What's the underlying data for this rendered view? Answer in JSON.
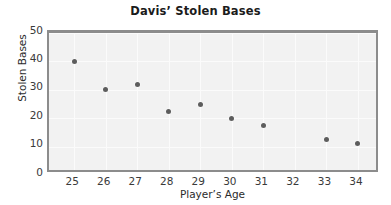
{
  "chart_data": {
    "type": "scatter",
    "title": "Davis’ Stolen Bases",
    "xlabel": "Player’s Age",
    "ylabel": "Stolen Bases",
    "xlim": [
      24.2,
      34.7
    ],
    "ylim": [
      0,
      50
    ],
    "xticks": [
      25,
      26,
      27,
      28,
      29,
      30,
      31,
      32,
      33,
      34
    ],
    "yticks": [
      0,
      10,
      20,
      30,
      40,
      50
    ],
    "xtick_labels": [
      "25",
      "26",
      "27",
      "28",
      "29",
      "30",
      "31",
      "32",
      "33",
      "34"
    ],
    "ytick_labels": [
      "0",
      "10",
      "20",
      "30",
      "40",
      "50"
    ],
    "grid": true,
    "legend": "none",
    "series": [
      {
        "name": "Stolen Bases",
        "marker_color": "#5d5d5d",
        "points": [
          {
            "x": 25,
            "y": 40
          },
          {
            "x": 26,
            "y": 30
          },
          {
            "x": 27,
            "y": 32
          },
          {
            "x": 28,
            "y": 22.5
          },
          {
            "x": 29,
            "y": 25
          },
          {
            "x": 30,
            "y": 20
          },
          {
            "x": 31,
            "y": 17.5
          },
          {
            "x": 33,
            "y": 12.5
          },
          {
            "x": 34,
            "y": 11
          }
        ]
      }
    ],
    "colors": {
      "plot_background": "#f2f2f2",
      "frame": "#8c8c8c",
      "gridline": "#fbfbfb",
      "marker": "#5d5d5d",
      "text": "#2b2b2b",
      "page_background": "#ffffff"
    }
  }
}
